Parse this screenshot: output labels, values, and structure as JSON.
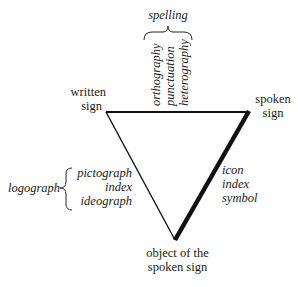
{
  "diagram": {
    "vertices": {
      "top_left": {
        "label_line1": "written",
        "label_line2": "sign"
      },
      "top_right": {
        "label_line1": "spoken",
        "label_line2": "sign"
      },
      "bottom": {
        "label_line1": "object of the",
        "label_line2": "spoken sign"
      }
    },
    "top_group": {
      "heading": "spelling",
      "items": [
        "orthography",
        "punctuation",
        "heterography"
      ]
    },
    "left_group": {
      "heading": "logograph",
      "items": [
        "pictograph",
        "index",
        "ideograph"
      ]
    },
    "right_group": {
      "items": [
        "icon",
        "index",
        "symbol"
      ]
    },
    "colors": {
      "line": "#111111",
      "background": "#ffffff"
    }
  }
}
